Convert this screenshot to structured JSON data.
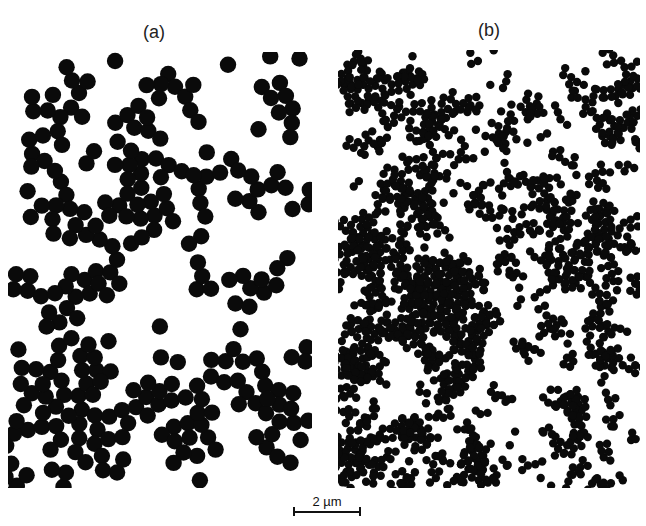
{
  "figure": {
    "panels": [
      {
        "label": "(a)",
        "description": "Micrograph of larger particles forming loose clusters",
        "particle_radius": 8.2,
        "particle_count": 620,
        "cluster_bias": 0.82,
        "seed": 17
      },
      {
        "label": "(b)",
        "description": "Micrograph of smaller particles forming dense fractal-like aggregates",
        "particle_radius": 4.2,
        "particle_count": 3300,
        "cluster_bias": 0.88,
        "seed": 91
      }
    ],
    "scale_bar": {
      "label": "2 µm"
    },
    "colors": {
      "particle": "#0a0a0a",
      "background": "#ffffff"
    }
  }
}
